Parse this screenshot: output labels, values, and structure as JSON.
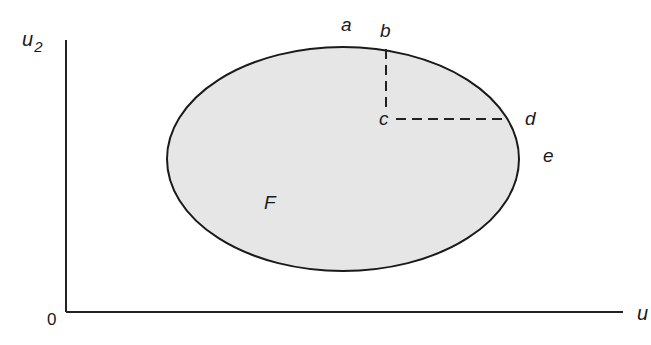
{
  "diagram": {
    "axes": {
      "y_label": "u",
      "y_label_sub": "2",
      "x_label": "u",
      "origin_label": "0"
    },
    "region": {
      "label": "F",
      "fill": "#e6e6e6",
      "stroke": "#1a1a1a"
    },
    "points": {
      "a": "a",
      "b": "b",
      "c": "c",
      "d": "d",
      "e": "e"
    }
  }
}
